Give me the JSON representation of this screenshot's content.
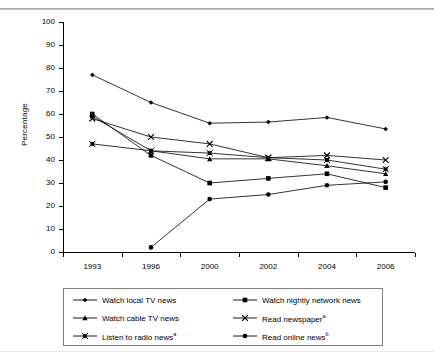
{
  "figure": {
    "ylabel": "Percentage",
    "top_rule": true
  },
  "chart_data": {
    "type": "line",
    "title": "",
    "xlabel": "",
    "ylabel": "Percentage",
    "categories": [
      "1993",
      "1996",
      "2000",
      "2002",
      "2004",
      "2006"
    ],
    "ylim": [
      0,
      100
    ],
    "yticks": [
      0,
      10,
      20,
      30,
      40,
      50,
      60,
      70,
      80,
      90,
      100
    ],
    "grid": false,
    "legend_position": "bottom",
    "series": [
      {
        "name": "Watch local TV news",
        "marker": "diamond",
        "values": [
          77,
          65,
          56,
          56.5,
          58.5,
          53.5
        ]
      },
      {
        "name": "Watch nightly network news",
        "marker": "square",
        "values": [
          60,
          42,
          30,
          32,
          34,
          28
        ]
      },
      {
        "name": "Watch cable TV news",
        "marker": "triangle",
        "values": [
          59,
          44,
          40.5,
          40.5,
          37.5,
          34
        ]
      },
      {
        "name": "Read newspaper",
        "name_sup": "a",
        "marker": "x",
        "values": [
          58,
          50,
          47,
          41,
          42,
          40
        ]
      },
      {
        "name": "Listen to radio news",
        "name_sup": "a",
        "marker": "x-square",
        "values": [
          47,
          44,
          43,
          41,
          40,
          36
        ]
      },
      {
        "name": "Read online news",
        "name_sup": "b",
        "marker": "circle",
        "values": [
          null,
          2,
          23,
          25,
          29,
          30.5
        ]
      }
    ]
  },
  "legend": {
    "items": [
      {
        "label": "Watch local TV news",
        "sup": "",
        "marker": "diamond"
      },
      {
        "label": "Watch nightly network news",
        "sup": "",
        "marker": "square"
      },
      {
        "label": "Watch cable TV news",
        "sup": "",
        "marker": "triangle"
      },
      {
        "label": "Read newspaper",
        "sup": "a",
        "marker": "x"
      },
      {
        "label": "Listen to radio news",
        "sup": "a",
        "marker": "x-square"
      },
      {
        "label": "Read online news",
        "sup": "b",
        "marker": "circle"
      }
    ]
  },
  "colors": {
    "line": "#000000",
    "axis": "#000000",
    "legend_border": "#808080",
    "rule": "#9a9a9a"
  }
}
